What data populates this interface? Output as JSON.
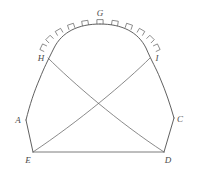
{
  "figure": {
    "background_color": "#ffffff",
    "line_color": "#4e4e4e",
    "label_color": "#4a4a4a",
    "width": 197,
    "height": 175,
    "labels": [
      {
        "id": "label-G",
        "text": "G",
        "x": 100,
        "y": 16,
        "anchor": "middle"
      },
      {
        "id": "label-H",
        "text": "H",
        "x": 41,
        "y": 61,
        "anchor": "middle"
      },
      {
        "id": "label-I",
        "text": "I",
        "x": 157,
        "y": 61,
        "anchor": "middle"
      },
      {
        "id": "label-A",
        "text": "A",
        "x": 18,
        "y": 123,
        "anchor": "middle"
      },
      {
        "id": "label-C",
        "text": "C",
        "x": 180,
        "y": 122,
        "anchor": "middle"
      },
      {
        "id": "label-E",
        "text": "E",
        "x": 28,
        "y": 163,
        "anchor": "middle"
      },
      {
        "id": "label-D",
        "text": "D",
        "x": 168,
        "y": 163,
        "anchor": "middle"
      }
    ],
    "points": {
      "G": {
        "x": 100,
        "y": 24
      },
      "H": {
        "x": 48,
        "y": 58
      },
      "I": {
        "x": 150,
        "y": 58
      },
      "A": {
        "x": 26,
        "y": 120
      },
      "C": {
        "x": 174,
        "y": 118
      },
      "E": {
        "x": 33,
        "y": 152
      },
      "D": {
        "x": 164,
        "y": 152
      }
    },
    "paths": {
      "left_profile": "M 26,120 C 30,104 34,92 40,78 C 44,68 47,62 54,48 C 62,32 78,24 100,24",
      "right_profile": "M 174,118 C 170,104 166,92 160,78 C 156,68 152,62 146,48 C 138,32 122,24 100,24",
      "chord_H_D": "M 48,58 C 72,82 118,122 164,152",
      "chord_I_E": "M 150,58 C 126,82 78,122 33,152",
      "side_AE": "M 26,120 L 33,152",
      "side_CD": "M 174,118 L 164,152",
      "base_ED": "M 33,152 L 164,152"
    },
    "arc_teeth": {
      "count": 11,
      "description": "small rectangular crenellation marks on the outside of the top arc",
      "start_angle_deg": 196,
      "end_angle_deg": 344
    }
  }
}
